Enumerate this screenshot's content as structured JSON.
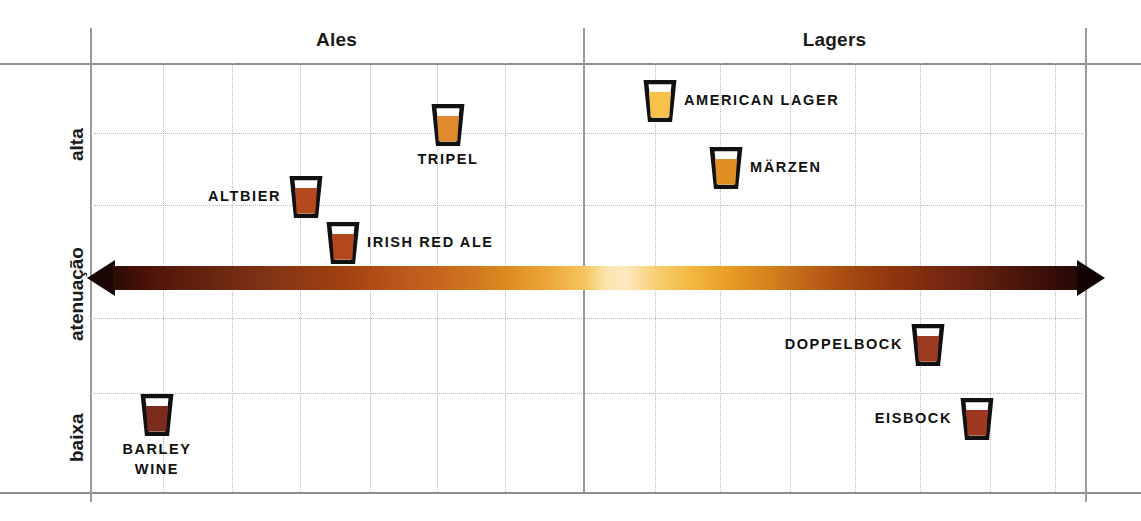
{
  "chart_data": {
    "type": "scatter",
    "title": "",
    "xlabel": "",
    "ylabel": "atenuação",
    "ylabel_high": "alta",
    "ylabel_low": "baixa",
    "grid": true,
    "sections": [
      "Ales",
      "Lagers"
    ],
    "axis_band": {
      "name": "color-gradient-arrow",
      "direction": "double-headed",
      "description": "cor da cerveja"
    },
    "points": [
      {
        "label": "TRIPEL",
        "section": "Ales",
        "x_px": 448,
        "y_px": 125,
        "beer_color": "#e08a2c",
        "label_pos": "below"
      },
      {
        "label": "ALTBIER",
        "section": "Ales",
        "x_px": 306,
        "y_px": 197,
        "beer_color": "#b4491f",
        "label_pos": "left-of"
      },
      {
        "label": "IRISH RED ALE",
        "section": "Ales",
        "x_px": 343,
        "y_px": 243,
        "beer_color": "#b5471e",
        "label_pos": "right-of"
      },
      {
        "label": "BARLEY\nWINE",
        "section": "Ales",
        "x_px": 157,
        "y_px": 415,
        "beer_color": "#7c2b1c",
        "label_pos": "below"
      },
      {
        "label": "AMERICAN LAGER",
        "section": "Lagers",
        "x_px": 660,
        "y_px": 101,
        "beer_color": "#f6c24a",
        "label_pos": "right-of"
      },
      {
        "label": "MÄRZEN",
        "section": "Lagers",
        "x_px": 726,
        "y_px": 168,
        "beer_color": "#e08f22",
        "label_pos": "right-of"
      },
      {
        "label": "DOPPELBOCK",
        "section": "Lagers",
        "x_px": 928,
        "y_px": 345,
        "beer_color": "#9d3a22",
        "label_pos": "left-of"
      },
      {
        "label": "EISBOCK",
        "section": "Lagers",
        "x_px": 977,
        "y_px": 419,
        "beer_color": "#9c3920",
        "label_pos": "left-of"
      }
    ],
    "vertical_gridlines_px": [
      163,
      232,
      300,
      370,
      437,
      505,
      655,
      720,
      790,
      855,
      920,
      990,
      1055
    ],
    "horizontal_gridlines_px": [
      133,
      205,
      318,
      393
    ],
    "colors": {
      "frame": "#8d8d8d",
      "grid": "#b9b9b9",
      "text": "#111111",
      "gradient_dark": "#2b0b06",
      "gradient_mid": "#c4631c",
      "gradient_light": "#fbe3ae"
    }
  },
  "labels": {
    "ales": "Ales",
    "lagers": "Lagers",
    "alta": "alta",
    "atenuacao": "atenuação",
    "baixa": "baixa"
  },
  "beers": {
    "tripel": "TRIPEL",
    "altbier": "ALTBIER",
    "irish_red_ale": "IRISH RED ALE",
    "barley_wine": "BARLEY\nWINE",
    "american_lager": "AMERICAN LAGER",
    "marzen": "MÄRZEN",
    "doppelbock": "DOPPELBOCK",
    "eisbock": "EISBOCK"
  }
}
